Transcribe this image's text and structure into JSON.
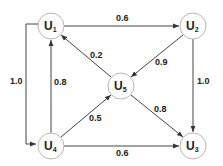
{
  "diagram": {
    "type": "weighted-directed-graph",
    "nodes": [
      {
        "id": "U1",
        "base": "U",
        "sub": "1",
        "x": 51,
        "y": 26
      },
      {
        "id": "U2",
        "base": "U",
        "sub": "2",
        "x": 193,
        "y": 26
      },
      {
        "id": "U3",
        "base": "U",
        "sub": "3",
        "x": 193,
        "y": 146
      },
      {
        "id": "U4",
        "base": "U",
        "sub": "4",
        "x": 51,
        "y": 146
      },
      {
        "id": "U5",
        "base": "U",
        "sub": "5",
        "x": 121,
        "y": 86
      }
    ],
    "edges": [
      {
        "from": "U1",
        "to": "U2",
        "weight": "0.6"
      },
      {
        "from": "U2",
        "to": "U5",
        "weight": "0.9"
      },
      {
        "from": "U2",
        "to": "U3",
        "weight": "1.0"
      },
      {
        "from": "U5",
        "to": "U1",
        "weight": "0.2"
      },
      {
        "from": "U5",
        "to": "U3",
        "weight": "0.8"
      },
      {
        "from": "U4",
        "to": "U1",
        "weight": "0.8"
      },
      {
        "from": "U4",
        "to": "U5",
        "weight": "0.5"
      },
      {
        "from": "U4",
        "to": "U3",
        "weight": "0.6"
      },
      {
        "from": "U1",
        "to": "U4",
        "weight": "1.0"
      }
    ]
  }
}
